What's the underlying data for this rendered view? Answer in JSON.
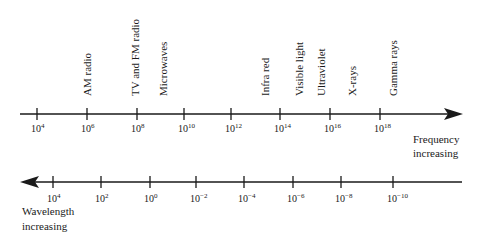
{
  "diagram": {
    "frequency_axis": {
      "caption_line1": "Frequency",
      "caption_line2": "increasing",
      "direction": "right",
      "ticks": [
        {
          "x": 37,
          "base": "10",
          "exp": "4"
        },
        {
          "x": 87,
          "base": "10",
          "exp": "6"
        },
        {
          "x": 137,
          "base": "10",
          "exp": "8"
        },
        {
          "x": 184,
          "base": "10",
          "exp": "10"
        },
        {
          "x": 231,
          "base": "10",
          "exp": "12"
        },
        {
          "x": 280,
          "base": "10",
          "exp": "14"
        },
        {
          "x": 330,
          "base": "10",
          "exp": "16"
        },
        {
          "x": 380,
          "base": "10",
          "exp": "18"
        }
      ]
    },
    "wavelength_axis": {
      "caption_line1": "Wavelength",
      "caption_line2": "increasing",
      "direction": "left",
      "ticks": [
        {
          "x": 53,
          "base": "10",
          "exp": "4"
        },
        {
          "x": 101,
          "base": "10",
          "exp": "2"
        },
        {
          "x": 150,
          "base": "10",
          "exp": "0"
        },
        {
          "x": 196,
          "base": "10",
          "exp": "−2"
        },
        {
          "x": 244,
          "base": "10",
          "exp": "−4"
        },
        {
          "x": 293,
          "base": "10",
          "exp": "−6"
        },
        {
          "x": 341,
          "base": "10",
          "exp": "−8"
        },
        {
          "x": 393,
          "base": "10",
          "exp": "−10"
        }
      ]
    },
    "bands": [
      {
        "label": "AM radio",
        "x": 91
      },
      {
        "label": "TV and FM radio",
        "x": 139
      },
      {
        "label": "Microwaves",
        "x": 167
      },
      {
        "label": "Infra red",
        "x": 269
      },
      {
        "label": "Visible light",
        "x": 303
      },
      {
        "label": "Ultraviolet",
        "x": 325
      },
      {
        "label": "X-rays",
        "x": 356
      },
      {
        "label": "Gamma rays",
        "x": 397
      }
    ],
    "colors": {
      "ink": "#1a1a1a",
      "background": "#ffffff"
    }
  }
}
